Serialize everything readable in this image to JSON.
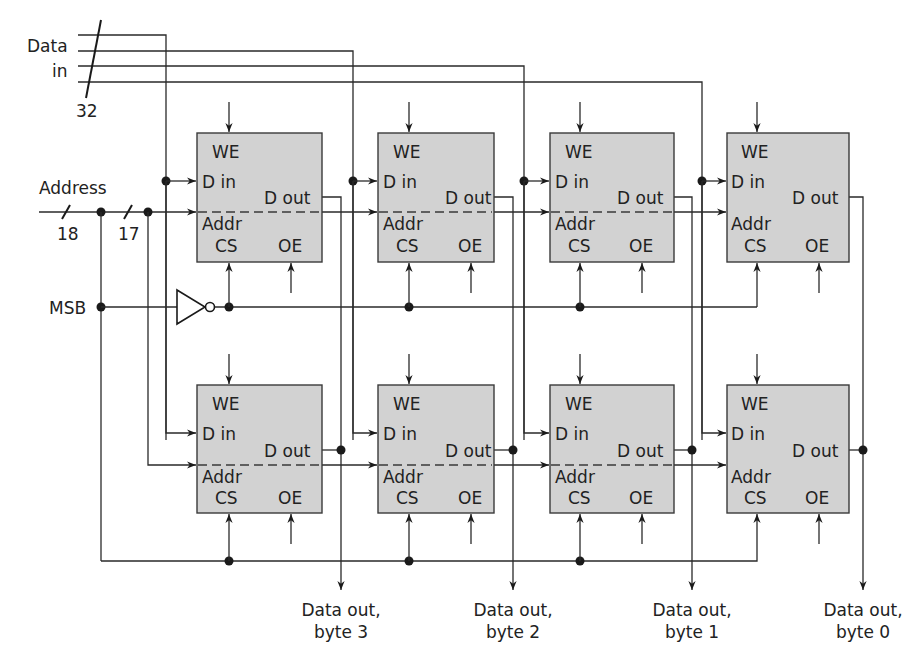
{
  "diagram": {
    "inputs": {
      "data_in_label_line1": "Data",
      "data_in_label_line2": "in",
      "data_in_width": "32",
      "address_label": "Address",
      "address_width": "18",
      "address_chip_width": "17",
      "msb_label": "MSB"
    },
    "chip_pins": {
      "we": "WE",
      "din": "D in",
      "dout": "D out",
      "addr": "Addr",
      "cs": "CS",
      "oe": "OE"
    },
    "outputs": [
      {
        "line1": "Data out,",
        "line2": "byte 3"
      },
      {
        "line1": "Data out,",
        "line2": "byte 2"
      },
      {
        "line1": "Data out,",
        "line2": "byte 1"
      },
      {
        "line1": "Data out,",
        "line2": "byte 0"
      }
    ],
    "rows": 2,
    "columns": 4,
    "colors": {
      "chip_fill": "#d2d2d2",
      "wire": "#2a2a2a",
      "background": "#ffffff"
    }
  }
}
